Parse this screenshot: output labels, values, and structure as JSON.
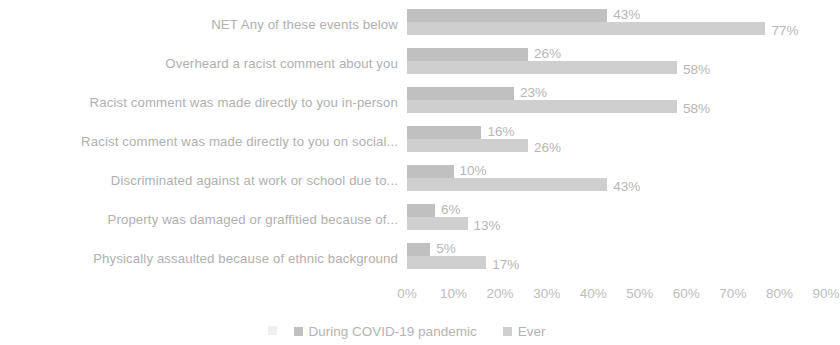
{
  "chart_data": {
    "type": "bar",
    "orientation": "horizontal",
    "grouped": true,
    "title": "",
    "subtitle": "",
    "xlabel": "",
    "ylabel": "",
    "xlim": [
      0,
      90
    ],
    "xtick_step": 10,
    "grid": false,
    "legend_position": "bottom",
    "value_suffix": "%",
    "categories": [
      "NET Any of these events below",
      "Overheard a racist comment about you",
      "Racist comment was made directly to you in-person",
      "Racist comment was made directly to you on social...",
      "Discriminated against at work or school due to...",
      "Property was damaged or graffitied because of...",
      "Physically assaulted because of ethnic background"
    ],
    "tick_labels": [
      "0%",
      "10%",
      "20%",
      "30%",
      "40%",
      "50%",
      "60%",
      "70%",
      "80%",
      "90%"
    ],
    "series": [
      {
        "name": "During COVID-19 pandemic",
        "color": "#c0c0c0",
        "values": [
          43,
          26,
          23,
          16,
          10,
          6,
          5
        ],
        "value_labels": [
          "43%",
          "26%",
          "23%",
          "16%",
          "10%",
          "6%",
          "5%"
        ]
      },
      {
        "name": "Ever",
        "color": "#cfcfcf",
        "values": [
          77,
          58,
          58,
          26,
          43,
          13,
          17
        ],
        "value_labels": [
          "77%",
          "58%",
          "58%",
          "26%",
          "43%",
          "13%",
          "17%"
        ]
      }
    ]
  }
}
